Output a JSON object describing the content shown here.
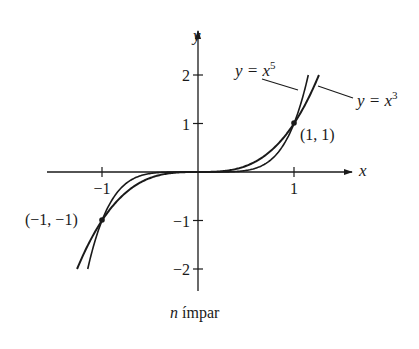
{
  "chart_data": {
    "type": "line",
    "title": "",
    "caption": {
      "variable": "n",
      "text": " ímpar"
    },
    "xlabel": "x",
    "ylabel": "y",
    "xlim": [
      -1.6,
      1.65
    ],
    "ylim": [
      -2.5,
      2.5
    ],
    "grid": false,
    "x_ticks": [
      {
        "value": -1,
        "label": "−1"
      },
      {
        "value": 1,
        "label": "1"
      }
    ],
    "y_ticks": [
      {
        "value": 2,
        "label": "2"
      },
      {
        "value": 1,
        "label": "1"
      },
      {
        "value": -1,
        "label": "−1"
      },
      {
        "value": -2,
        "label": "−2"
      }
    ],
    "series": [
      {
        "name": "y = x^5",
        "label_prefix": "y = x",
        "label_exponent": "5",
        "exponent": 5,
        "x": [
          -1.149,
          -1.0,
          -0.8,
          -0.6,
          -0.4,
          -0.2,
          0,
          0.2,
          0.4,
          0.6,
          0.8,
          1.0,
          1.149
        ],
        "values": [
          -2.0,
          -1.0,
          -0.328,
          -0.078,
          -0.01,
          -0.0003,
          0,
          0.0003,
          0.01,
          0.078,
          0.328,
          1.0,
          2.0
        ]
      },
      {
        "name": "y = x^3",
        "label_prefix": "y = x",
        "label_exponent": "3",
        "exponent": 3,
        "x": [
          -1.26,
          -1.0,
          -0.8,
          -0.6,
          -0.4,
          -0.2,
          0,
          0.2,
          0.4,
          0.6,
          0.8,
          1.0,
          1.26
        ],
        "values": [
          -2.0,
          -1.0,
          -0.512,
          -0.216,
          -0.064,
          -0.008,
          0,
          0.008,
          0.064,
          0.216,
          0.512,
          1.0,
          2.0
        ]
      }
    ],
    "annotations": [
      {
        "point": [
          1,
          1
        ],
        "label": "(1, 1)"
      },
      {
        "point": [
          -1,
          -1
        ],
        "label": "(−1, −1)"
      }
    ],
    "legend": "inline labels with leader lines (upper right)"
  }
}
